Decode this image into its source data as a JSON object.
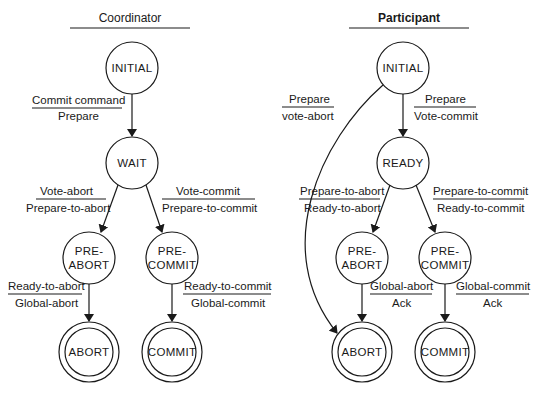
{
  "diagram": {
    "type": "state-transition",
    "header_partial": "",
    "panels": [
      {
        "title": "Coordinator",
        "states": [
          {
            "id": "c_initial",
            "label": [
              "INITIAL"
            ],
            "final": false
          },
          {
            "id": "c_wait",
            "label": [
              "WAIT"
            ],
            "final": false
          },
          {
            "id": "c_preabort",
            "label": [
              "PRE-",
              "ABORT"
            ],
            "final": false
          },
          {
            "id": "c_precommit",
            "label": [
              "PRE-",
              "COMMIT"
            ],
            "final": false
          },
          {
            "id": "c_abort",
            "label": [
              "ABORT"
            ],
            "final": true
          },
          {
            "id": "c_commit",
            "label": [
              "COMMIT"
            ],
            "final": true
          }
        ],
        "transitions": [
          {
            "from": "c_initial",
            "to": "c_wait",
            "input": "Commit command",
            "output": "Prepare"
          },
          {
            "from": "c_wait",
            "to": "c_preabort",
            "input": "Vote-abort",
            "output": "Prepare-to-abort"
          },
          {
            "from": "c_wait",
            "to": "c_precommit",
            "input": "Vote-commit",
            "output": "Prepare-to-commit"
          },
          {
            "from": "c_preabort",
            "to": "c_abort",
            "input": "Ready-to-abort",
            "output": "Global-abort"
          },
          {
            "from": "c_precommit",
            "to": "c_commit",
            "input": "Ready-to-commit",
            "output": "Global-commit"
          }
        ]
      },
      {
        "title": "Participant",
        "states": [
          {
            "id": "p_initial",
            "label": [
              "INITIAL"
            ],
            "final": false
          },
          {
            "id": "p_ready",
            "label": [
              "READY"
            ],
            "final": false
          },
          {
            "id": "p_preabort",
            "label": [
              "PRE-",
              "ABORT"
            ],
            "final": false
          },
          {
            "id": "p_precommit",
            "label": [
              "PRE-",
              "COMMIT"
            ],
            "final": false
          },
          {
            "id": "p_abort",
            "label": [
              "ABORT"
            ],
            "final": true
          },
          {
            "id": "p_commit",
            "label": [
              "COMMIT"
            ],
            "final": true
          }
        ],
        "transitions": [
          {
            "from": "p_initial",
            "to": "p_abort",
            "input": "Prepare",
            "output": "vote-abort"
          },
          {
            "from": "p_initial",
            "to": "p_ready",
            "input": "Prepare",
            "output": "Vote-commit"
          },
          {
            "from": "p_ready",
            "to": "p_preabort",
            "input": "Prepare-to-abort",
            "output": "Ready-to-abort"
          },
          {
            "from": "p_ready",
            "to": "p_precommit",
            "input": "Prepare-to-commit",
            "output": "Ready-to-commit"
          },
          {
            "from": "p_preabort",
            "to": "p_abort",
            "input": "Global-abort",
            "output": "Ack"
          },
          {
            "from": "p_precommit",
            "to": "p_commit",
            "input": "Global-commit",
            "output": "Ack"
          }
        ]
      }
    ]
  },
  "colors": {
    "ink": "#1a1a1a",
    "background": "#ffffff"
  }
}
